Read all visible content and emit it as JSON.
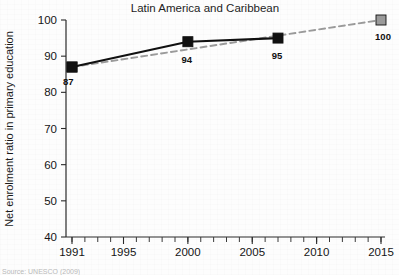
{
  "figure": {
    "title": "Latin America and Caribbean",
    "source_note": "Source: UNESCO (2009)"
  },
  "chart_data": {
    "type": "line",
    "title": "Latin America and Caribbean",
    "xlabel": "",
    "ylabel": "Net enrolment ratio in primary education",
    "xlim": [
      1991,
      2015
    ],
    "ylim": [
      40,
      100
    ],
    "grid": false,
    "legend": "none",
    "x_ticks_major": [
      1991,
      1995,
      2000,
      2005,
      2010,
      2015
    ],
    "x_tick_labels": [
      "1991",
      "1995",
      "2000",
      "2005",
      "2010",
      "2015"
    ],
    "x_minor_tick_step": 1,
    "y_ticks": [
      40,
      50,
      60,
      70,
      80,
      90,
      100
    ],
    "y_tick_labels": [
      "40",
      "50",
      "60",
      "70",
      "80",
      "90",
      "100"
    ],
    "series": [
      {
        "name": "observed",
        "style": "solid",
        "color": "#111111",
        "marker": "square",
        "marker_color": "#111111",
        "x": [
          1991,
          2000,
          2007
        ],
        "values": [
          87,
          94,
          95
        ],
        "point_labels": [
          "87",
          "94",
          "95"
        ]
      },
      {
        "name": "target-trajectory",
        "style": "dashed",
        "color": "#9a9a9a",
        "marker": "square",
        "marker_color": "#9a9a9a",
        "x": [
          1991,
          2015
        ],
        "values": [
          87,
          100
        ],
        "point_labels": [
          "",
          "100"
        ]
      }
    ],
    "annotations": [
      {
        "text": "87",
        "x": 1991,
        "y": 87
      },
      {
        "text": "94",
        "x": 2000,
        "y": 94
      },
      {
        "text": "95",
        "x": 2007,
        "y": 95
      },
      {
        "text": "100",
        "x": 2015,
        "y": 100
      }
    ]
  },
  "colors": {
    "observed_line": "#111111",
    "target_line": "#9a9a9a",
    "axis": "#2a2a2a",
    "background": "#fdfdfd"
  }
}
